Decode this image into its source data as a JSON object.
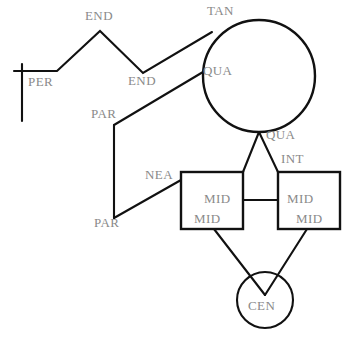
{
  "diagram": {
    "colors": {
      "stroke": "#111111",
      "label_text": "#8a8a8a",
      "background": "#ffffff",
      "shape_fill": "#ffffff"
    },
    "nodes": [
      {
        "id": "line-horizontal",
        "type": "line-segment",
        "label": "PER"
      },
      {
        "id": "circle-large",
        "type": "circle",
        "cx": 259,
        "cy": 76,
        "r": 56
      },
      {
        "id": "box-left",
        "type": "square",
        "x": 181,
        "y": 172,
        "w": 62,
        "h": 57
      },
      {
        "id": "box-right",
        "type": "square",
        "x": 278,
        "y": 172,
        "w": 62,
        "h": 57
      },
      {
        "id": "circle-small",
        "type": "circle",
        "cx": 265,
        "cy": 300,
        "r": 28
      }
    ],
    "labels": [
      {
        "id": "label-per",
        "text": "PER",
        "x": 28,
        "y": 75
      },
      {
        "id": "label-end-top",
        "text": "END",
        "x": 85,
        "y": 9
      },
      {
        "id": "label-end-valley",
        "text": "END",
        "x": 128,
        "y": 74
      },
      {
        "id": "label-tan",
        "text": "TAN",
        "x": 207,
        "y": 4
      },
      {
        "id": "label-qua-upper",
        "text": "QUA",
        "x": 203,
        "y": 64
      },
      {
        "id": "label-par-upper",
        "text": "PAR",
        "x": 91,
        "y": 107
      },
      {
        "id": "label-qua-lower",
        "text": "QUA",
        "x": 266,
        "y": 128
      },
      {
        "id": "label-int",
        "text": "INT",
        "x": 281,
        "y": 152
      },
      {
        "id": "label-nea",
        "text": "NEA",
        "x": 145,
        "y": 168
      },
      {
        "id": "label-par-lower",
        "text": "PAR",
        "x": 94,
        "y": 216
      },
      {
        "id": "label-mid-left-upper",
        "text": "MID",
        "x": 204,
        "y": 192
      },
      {
        "id": "label-mid-left-lower",
        "text": "MID",
        "x": 194,
        "y": 212
      },
      {
        "id": "label-mid-right-upper",
        "text": "MID",
        "x": 287,
        "y": 192
      },
      {
        "id": "label-mid-right-lower",
        "text": "MID",
        "x": 296,
        "y": 212
      },
      {
        "id": "label-cen",
        "text": "CEN",
        "x": 248,
        "y": 299
      }
    ],
    "paths": {
      "per_polyline": "M14,71 L57,71 L100,31 L143,73 L212,32",
      "per_tick": "M22,64 L22,121",
      "par_upper": "M114,125 L203,72",
      "par_vertical": "M114,125 L114,218",
      "nea_line": "M114,218 L181,180",
      "qua_to_boxleft": "M259,132 L243,172",
      "int_to_boxright": "M259,132 L278,172",
      "box_to_box": "M243,200 L278,200",
      "boxleft_to_cen": "M214,229 L265,295",
      "boxright_to_cen": "M307,229 L265,295"
    }
  }
}
